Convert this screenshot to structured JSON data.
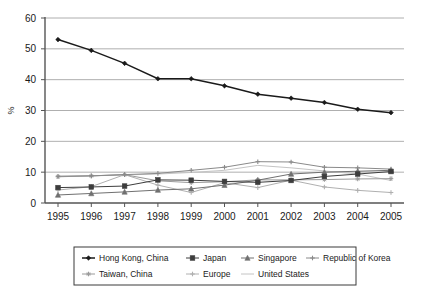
{
  "chart_data": {
    "type": "line",
    "title": "",
    "xlabel": "",
    "ylabel": "%",
    "ylim": [
      0,
      60
    ],
    "yticks": [
      0,
      10,
      20,
      30,
      40,
      50,
      60
    ],
    "grid": true,
    "legend_position": "bottom",
    "categories": [
      "1995",
      "1996",
      "1997",
      "1998",
      "1999",
      "2000",
      "2001",
      "2002",
      "2003",
      "2004",
      "2005"
    ],
    "series": [
      {
        "name": "Hong Kong, China",
        "color": "#1a1a1a",
        "marker": "diamond",
        "values": [
          53.0,
          49.5,
          45.3,
          40.3,
          40.3,
          38.0,
          35.3,
          34.0,
          32.6,
          30.4,
          29.3
        ]
      },
      {
        "name": "Japan",
        "color": "#3d3d3d",
        "marker": "square",
        "values": [
          5.0,
          5.2,
          5.5,
          7.5,
          7.4,
          7.0,
          6.7,
          7.3,
          8.6,
          9.4,
          10.2
        ]
      },
      {
        "name": "Singapore",
        "color": "#707070",
        "marker": "triangle",
        "values": [
          2.6,
          3.1,
          3.6,
          4.2,
          4.6,
          5.8,
          7.4,
          9.4,
          10.0,
          10.3,
          10.6
        ]
      },
      {
        "name": "Republic of Korea",
        "color": "#8a8a8a",
        "marker": "cross",
        "values": [
          8.7,
          8.8,
          9.2,
          9.6,
          10.6,
          11.6,
          13.4,
          13.3,
          11.6,
          11.4,
          11.0
        ]
      },
      {
        "name": "Taiwan, China",
        "color": "#9a9a9a",
        "marker": "star",
        "values": [
          8.5,
          8.8,
          9.2,
          7.2,
          6.6,
          6.9,
          7.5,
          7.5,
          7.6,
          7.8,
          7.9
        ]
      },
      {
        "name": "Europe",
        "color": "#b0b0b0",
        "marker": "plus",
        "values": [
          4.2,
          5.3,
          9.2,
          5.8,
          3.4,
          6.6,
          5.0,
          7.4,
          5.2,
          4.1,
          3.4
        ]
      },
      {
        "name": "United States",
        "color": "#c4c4c4",
        "marker": "none",
        "values": [
          8.6,
          8.8,
          9.1,
          9.4,
          9.9,
          10.6,
          12.2,
          11.4,
          10.4,
          9.4,
          7.3
        ]
      }
    ]
  },
  "legend": {
    "rows": [
      [
        "Hong Kong, China",
        "Japan",
        "Singapore",
        "Republic of Korea"
      ],
      [
        "Taiwan, China",
        "Europe",
        "United States"
      ]
    ]
  }
}
